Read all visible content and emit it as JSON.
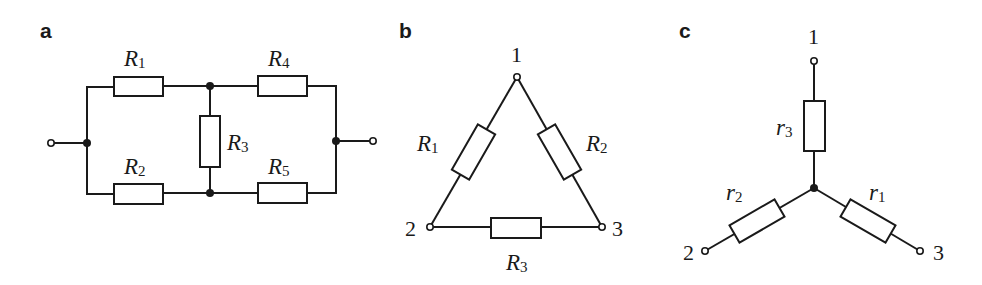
{
  "panels": {
    "a": {
      "label": "a",
      "title": "Bridge resistor network",
      "resistors": [
        {
          "name": "R",
          "sub": "1"
        },
        {
          "name": "R",
          "sub": "2"
        },
        {
          "name": "R",
          "sub": "3"
        },
        {
          "name": "R",
          "sub": "4"
        },
        {
          "name": "R",
          "sub": "5"
        }
      ]
    },
    "b": {
      "label": "b",
      "title": "Delta (triangle) connection",
      "nodes": [
        "1",
        "2",
        "3"
      ],
      "resistors": [
        {
          "name": "R",
          "sub": "1"
        },
        {
          "name": "R",
          "sub": "2"
        },
        {
          "name": "R",
          "sub": "3"
        }
      ]
    },
    "c": {
      "label": "c",
      "title": "Star (wye) connection",
      "nodes": [
        "1",
        "2",
        "3"
      ],
      "resistors": [
        {
          "name": "r",
          "sub": "1"
        },
        {
          "name": "r",
          "sub": "2"
        },
        {
          "name": "r",
          "sub": "3"
        }
      ]
    }
  },
  "colors": {
    "ink": "#1a1a1a",
    "background": "#ffffff"
  }
}
